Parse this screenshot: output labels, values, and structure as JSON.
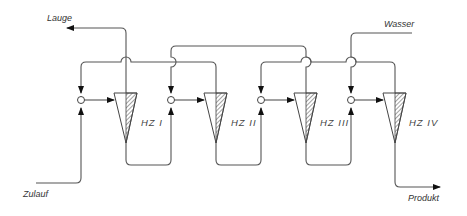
{
  "diagram": {
    "type": "process-flow",
    "streams": {
      "lauge": "Lauge",
      "wasser": "Wasser",
      "zulauf": "Zulauf",
      "produkt": "Produkt"
    },
    "cyclones": [
      {
        "id": "hz1",
        "label": "HZ  I"
      },
      {
        "id": "hz2",
        "label": "HZ  II"
      },
      {
        "id": "hz3",
        "label": "HZ  III"
      },
      {
        "id": "hz4",
        "label": "HZ  IV"
      }
    ],
    "mixers": [
      {
        "id": "m1"
      },
      {
        "id": "m2"
      },
      {
        "id": "m3"
      },
      {
        "id": "m4"
      }
    ],
    "connections": [
      {
        "from": "Zulauf",
        "to": "m1"
      },
      {
        "from": "m1",
        "to": "hz1"
      },
      {
        "from": "hz1.overflow",
        "to": "Lauge"
      },
      {
        "from": "hz1.underflow",
        "to": "m2"
      },
      {
        "from": "hz2.overflow",
        "to": "m1"
      },
      {
        "from": "m2",
        "to": "hz2"
      },
      {
        "from": "hz2.underflow",
        "to": "m3"
      },
      {
        "from": "hz3.overflow",
        "to": "m2"
      },
      {
        "from": "m3",
        "to": "hz3"
      },
      {
        "from": "hz3.underflow",
        "to": "m4"
      },
      {
        "from": "hz4.overflow",
        "to": "m3"
      },
      {
        "from": "Wasser",
        "to": "m4"
      },
      {
        "from": "m4",
        "to": "hz4"
      },
      {
        "from": "hz4.underflow",
        "to": "Produkt"
      }
    ],
    "colors": {
      "line": "#555555",
      "text": "#333333",
      "background": "#ffffff"
    }
  }
}
